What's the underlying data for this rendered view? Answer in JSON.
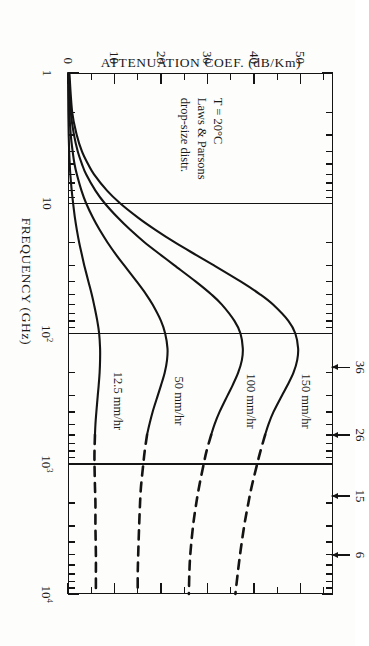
{
  "figure": {
    "orientation": "rotated-90-cw",
    "background": "#fdfdfb",
    "ink": "#141414"
  },
  "axis_titles": {
    "x": "FREQUENCY  (GHz)",
    "y": "ATTENUATION COEF.   (dB/Km)"
  },
  "annotation": {
    "line1": "T = 20°C",
    "line2": "Laws & Parsons",
    "line3": "drop-size distr."
  },
  "xticklabels": [
    {
      "value": 1,
      "text": "1",
      "sup": ""
    },
    {
      "value": 10,
      "text": "10",
      "sup": ""
    },
    {
      "value": 100,
      "text": "10",
      "sup": "2"
    },
    {
      "value": 1000,
      "text": "10",
      "sup": "3"
    },
    {
      "value": 10000,
      "text": "10",
      "sup": "4"
    }
  ],
  "yticklabels": [
    {
      "value": 0,
      "text": "0"
    },
    {
      "value": 10,
      "text": "10"
    },
    {
      "value": 20,
      "text": "20"
    },
    {
      "value": 30,
      "text": "30"
    },
    {
      "value": 40,
      "text": "40"
    },
    {
      "value": 50,
      "text": "50"
    }
  ],
  "curve_labels": [
    {
      "text": "150 mm/hr"
    },
    {
      "text": "100 mm/hr"
    },
    {
      "text": "50 mm/hr"
    },
    {
      "text": "12.5 mm/hr"
    }
  ],
  "endpoint_arrows": [
    {
      "text": "36",
      "value": 36
    },
    {
      "text": "26",
      "value": 26
    },
    {
      "text": "15",
      "value": 15
    },
    {
      "text": "6",
      "value": 6
    }
  ],
  "chart_data": {
    "type": "line",
    "title": "",
    "xlabel": "FREQUENCY  (GHz)",
    "ylabel": "ATTENUATION COEF.   (dB/Km)",
    "xscale": "log",
    "yscale": "linear",
    "xlim": [
      1,
      10000
    ],
    "ylim": [
      0,
      57
    ],
    "grid": false,
    "legend": "inline-curve-labels",
    "annotations": [
      "T = 20°C",
      "Laws & Parsons drop-size distr.",
      "Arrows at 10^4 GHz mark asymptotic values 36, 26, 15, 6 dB/km"
    ],
    "xticks": [
      1,
      10,
      100,
      1000,
      10000
    ],
    "yticks": [
      0,
      10,
      20,
      30,
      40,
      50
    ],
    "series": [
      {
        "name": "150 mm/hr",
        "solid_range": [
          1,
          600
        ],
        "dashed_range": [
          600,
          10000
        ],
        "x": [
          1,
          2,
          3,
          4,
          5,
          6,
          8,
          10,
          13,
          16,
          20,
          25,
          30,
          40,
          50,
          60,
          80,
          100,
          130,
          160,
          200,
          250,
          300,
          400,
          500,
          600,
          800,
          1000,
          1500,
          2000,
          3000,
          5000,
          7000,
          10000
        ],
        "y": [
          0.3,
          0.9,
          1.9,
          3.0,
          4.3,
          5.6,
          8.4,
          11.2,
          15.2,
          18.8,
          23.0,
          27.6,
          31.4,
          37.2,
          41.3,
          44.1,
          47.4,
          48.9,
          49.5,
          49.3,
          48.5,
          47.2,
          46.0,
          44.2,
          43.1,
          42.4,
          41.4,
          40.7,
          39.5,
          38.8,
          37.9,
          37.0,
          36.5,
          36.0
        ]
      },
      {
        "name": "100 mm/hr",
        "solid_range": [
          1,
          600
        ],
        "dashed_range": [
          600,
          10000
        ],
        "x": [
          1,
          2,
          3,
          4,
          5,
          6,
          8,
          10,
          13,
          16,
          20,
          25,
          30,
          40,
          50,
          60,
          80,
          100,
          130,
          160,
          200,
          250,
          300,
          400,
          500,
          600,
          800,
          1000,
          1500,
          2000,
          3000,
          5000,
          7000,
          10000
        ],
        "y": [
          0.2,
          0.6,
          1.3,
          2.1,
          3.0,
          3.9,
          5.9,
          7.9,
          10.8,
          13.4,
          16.5,
          20.0,
          22.9,
          27.5,
          30.8,
          33.1,
          35.8,
          37.1,
          37.6,
          37.4,
          36.6,
          35.4,
          34.3,
          32.6,
          31.5,
          30.8,
          29.8,
          29.2,
          28.2,
          27.6,
          26.9,
          26.3,
          26.1,
          26.0
        ]
      },
      {
        "name": "50 mm/hr",
        "solid_range": [
          1,
          600
        ],
        "dashed_range": [
          600,
          10000
        ],
        "x": [
          1,
          2,
          3,
          4,
          5,
          6,
          8,
          10,
          13,
          16,
          20,
          25,
          30,
          40,
          50,
          60,
          80,
          100,
          130,
          160,
          200,
          250,
          300,
          400,
          500,
          600,
          800,
          1000,
          1500,
          2000,
          3000,
          5000,
          7000,
          10000
        ],
        "y": [
          0.1,
          0.3,
          0.6,
          1.0,
          1.4,
          1.9,
          2.9,
          3.9,
          5.4,
          6.8,
          8.5,
          10.4,
          12.1,
          14.8,
          16.8,
          18.2,
          20.0,
          20.9,
          21.4,
          21.3,
          20.8,
          20.0,
          19.3,
          18.2,
          17.5,
          17.0,
          16.5,
          16.2,
          15.7,
          15.5,
          15.3,
          15.1,
          15.0,
          15.0
        ]
      },
      {
        "name": "12.5 mm/hr",
        "solid_range": [
          1,
          600
        ],
        "dashed_range": [
          600,
          10000
        ],
        "x": [
          1,
          2,
          3,
          4,
          5,
          6,
          8,
          10,
          13,
          16,
          20,
          25,
          30,
          40,
          50,
          60,
          80,
          100,
          130,
          160,
          200,
          250,
          300,
          400,
          500,
          600,
          800,
          1000,
          1500,
          2000,
          3000,
          5000,
          7000,
          10000
        ],
        "y": [
          0.02,
          0.07,
          0.15,
          0.25,
          0.37,
          0.5,
          0.8,
          1.1,
          1.5,
          1.9,
          2.4,
          3.0,
          3.5,
          4.4,
          5.1,
          5.6,
          6.3,
          6.7,
          6.9,
          6.9,
          6.8,
          6.6,
          6.4,
          6.1,
          5.9,
          5.8,
          5.7,
          5.7,
          5.8,
          5.9,
          5.9,
          6.0,
          6.0,
          6.0
        ]
      }
    ]
  }
}
